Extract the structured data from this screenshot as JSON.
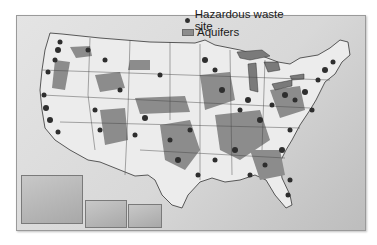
{
  "legend": {
    "items": [
      {
        "label": "Hazardous waste site",
        "symbol": "dot",
        "color": "#2e2e2e"
      },
      {
        "label": "Aquifers",
        "symbol": "swatch",
        "color": "#8c8c8c"
      }
    ]
  },
  "map": {
    "subject": "Contiguous United States",
    "insets": [
      {
        "name": "Alaska"
      },
      {
        "name": "Hawaii"
      },
      {
        "name": "Puerto Rico"
      }
    ],
    "colors": {
      "land": "#ececec",
      "aquifer": "#8c8c8c",
      "lakes": "#7a7a7a",
      "site": "#2e2e2e",
      "borders": "#333333"
    }
  }
}
